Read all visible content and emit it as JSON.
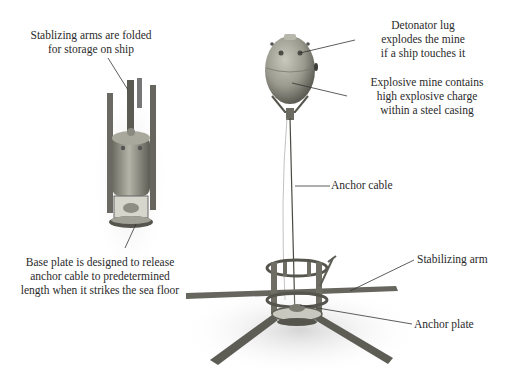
{
  "diagram": {
    "labels": {
      "folded_arms": [
        "Stablizing arms are folded",
        "for storage on ship"
      ],
      "base_plate": [
        "Base plate is designed to release",
        "anchor cable to predetermined",
        "length when it strikes the sea floor"
      ],
      "detonator_lug": [
        "Detonator lug",
        "explodes the mine",
        "if a ship touches it"
      ],
      "explosive_mine": [
        "Explosive mine contains",
        "high explosive charge",
        "within a steel casing"
      ],
      "anchor_cable": "Anchor cable",
      "stabilizing_arm": "Stabilizing arm",
      "anchor_plate": "Anchor plate"
    },
    "colors": {
      "background": "#ffffff",
      "text": "#2a2a2a",
      "leader_line": "#333333",
      "mine_body": "#9a9a8e",
      "metal_dark": "#4a4a44",
      "shadow": "#d9d9d9"
    }
  }
}
